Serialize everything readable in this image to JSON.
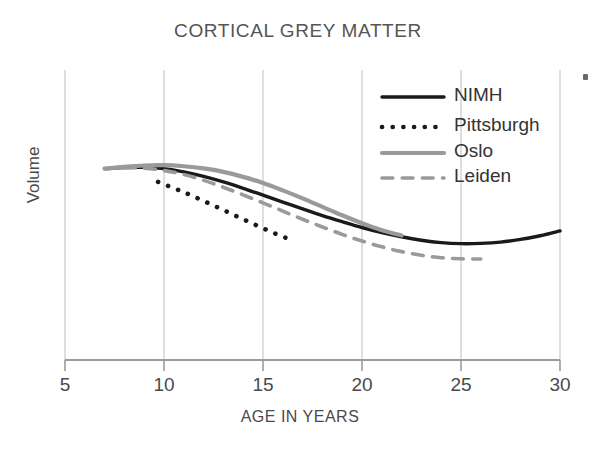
{
  "chart_data": {
    "type": "line",
    "title": "CORTICAL GREY MATTER",
    "xlabel": "AGE IN YEARS",
    "ylabel": "Volume",
    "xlim": [
      5,
      30
    ],
    "ylim": [
      0,
      1
    ],
    "xticks": [
      5,
      10,
      15,
      20,
      25,
      30
    ],
    "xtick_labels": [
      "5",
      "10",
      "15",
      "20",
      "25",
      "30"
    ],
    "yticks": [],
    "ytick_labels": [],
    "grid": "vertical-only",
    "legend_position": "top-right",
    "series": [
      {
        "name": "NIMH",
        "style": "solid",
        "color": "#1a1a1a",
        "width": 3.4,
        "x": [
          7.0,
          8.0,
          9.0,
          10.0,
          11.0,
          12.0,
          13.0,
          14.0,
          15.0,
          16.0,
          17.0,
          18.0,
          19.0,
          20.0,
          21.0,
          22.0,
          23.0,
          24.0,
          25.0,
          26.0,
          27.0,
          28.0,
          29.0,
          30.0
        ],
        "y": [
          0.722,
          0.726,
          0.727,
          0.722,
          0.71,
          0.693,
          0.672,
          0.648,
          0.622,
          0.596,
          0.57,
          0.545,
          0.522,
          0.5,
          0.481,
          0.465,
          0.452,
          0.443,
          0.439,
          0.44,
          0.445,
          0.455,
          0.469,
          0.487
        ]
      },
      {
        "name": "Pittsburgh",
        "style": "dotted",
        "color": "#1a1a1a",
        "width": 4.6,
        "x": [
          9.7,
          10.5,
          11.0,
          11.5,
          12.0,
          12.5,
          13.0,
          13.5,
          14.0,
          14.5,
          15.0,
          15.5,
          16.0,
          16.2
        ],
        "y": [
          0.672,
          0.648,
          0.633,
          0.617,
          0.6,
          0.583,
          0.566,
          0.548,
          0.531,
          0.514,
          0.497,
          0.481,
          0.466,
          0.46
        ]
      },
      {
        "name": "Oslo",
        "style": "solid",
        "color": "#9a9a9a",
        "width": 4.2,
        "x": [
          7.0,
          8.0,
          9.0,
          10.0,
          11.0,
          12.0,
          13.0,
          14.0,
          15.0,
          16.0,
          17.0,
          18.0,
          19.0,
          20.0,
          21.0,
          22.0
        ],
        "y": [
          0.722,
          0.729,
          0.734,
          0.735,
          0.731,
          0.723,
          0.71,
          0.691,
          0.668,
          0.64,
          0.61,
          0.578,
          0.546,
          0.516,
          0.49,
          0.47
        ]
      },
      {
        "name": "Leiden",
        "style": "dashed",
        "color": "#9a9a9a",
        "width": 3.6,
        "x": [
          8.0,
          9.0,
          10.0,
          11.0,
          12.0,
          13.0,
          14.0,
          15.0,
          16.0,
          17.0,
          18.0,
          19.0,
          20.0,
          21.0,
          22.0,
          23.0,
          24.0,
          25.0,
          26.0
        ],
        "y": [
          0.726,
          0.724,
          0.715,
          0.7,
          0.678,
          0.652,
          0.623,
          0.593,
          0.562,
          0.531,
          0.502,
          0.474,
          0.449,
          0.427,
          0.409,
          0.395,
          0.386,
          0.382,
          0.381
        ]
      }
    ]
  },
  "legend": {
    "items": [
      {
        "label": "NIMH",
        "style": "solid",
        "color": "#1a1a1a"
      },
      {
        "label": "Pittsburgh",
        "style": "dotted",
        "color": "#1a1a1a"
      },
      {
        "label": "Oslo",
        "style": "solid",
        "color": "#9a9a9a"
      },
      {
        "label": "Leiden",
        "style": "dashed",
        "color": "#9a9a9a"
      }
    ]
  },
  "colors": {
    "nimh": "#1a1a1a",
    "pittsburgh": "#1a1a1a",
    "oslo": "#9a9a9a",
    "leiden": "#9a9a9a",
    "axis": "#9b9b9b",
    "grid": "#c9c9c9",
    "title_text": "#555555",
    "label_text": "#4a4a4a"
  }
}
